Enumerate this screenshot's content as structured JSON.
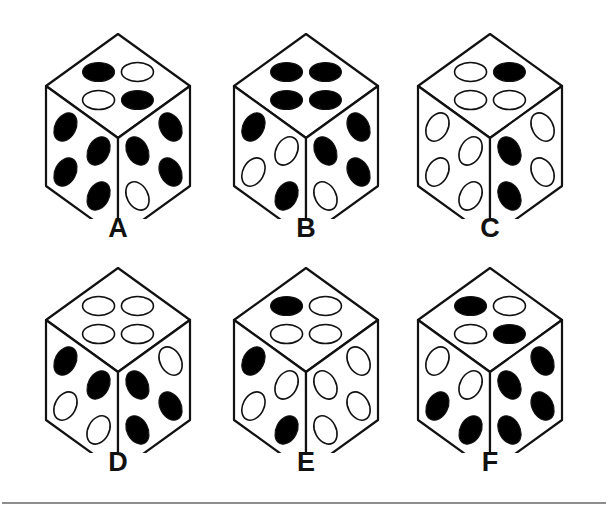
{
  "page": {
    "background_color": "#ffffff",
    "ink_color": "#111111",
    "pip_filled_color": "#000000",
    "pip_hollow_color": "#ffffff",
    "rule_color": "#8d8d8d",
    "columns": 3,
    "rows": 2,
    "total_dice": 6
  },
  "divider": {
    "name": "bottom-horizontal-rule",
    "visible": true
  },
  "dice": [
    {
      "label": "A",
      "x": 28,
      "y": 24,
      "top_face": {
        "back": "hollow",
        "left": "filled",
        "right": "filled",
        "front": "hollow",
        "filled_count": 2
      },
      "left_face": {
        "top_left": "filled",
        "top_right": "filled",
        "bottom_left": "filled",
        "bottom_right": "filled",
        "filled_count": 4
      },
      "right_face": {
        "top_left": "filled",
        "top_right": "filled",
        "bottom_left": "hollow",
        "bottom_right": "filled",
        "filled_count": 3
      }
    },
    {
      "label": "B",
      "x": 216,
      "y": 24,
      "top_face": {
        "back": "filled",
        "left": "filled",
        "right": "filled",
        "front": "filled",
        "filled_count": 4
      },
      "left_face": {
        "top_left": "filled",
        "top_right": "hollow",
        "bottom_left": "hollow",
        "bottom_right": "filled",
        "filled_count": 2
      },
      "right_face": {
        "top_left": "filled",
        "top_right": "filled",
        "bottom_left": "hollow",
        "bottom_right": "filled",
        "filled_count": 3
      }
    },
    {
      "label": "C",
      "x": 400,
      "y": 24,
      "top_face": {
        "back": "filled",
        "left": "hollow",
        "right": "hollow",
        "front": "hollow",
        "filled_count": 1
      },
      "left_face": {
        "top_left": "hollow",
        "top_right": "hollow",
        "bottom_left": "hollow",
        "bottom_right": "hollow",
        "filled_count": 0
      },
      "right_face": {
        "top_left": "filled",
        "top_right": "hollow",
        "bottom_left": "filled",
        "bottom_right": "hollow",
        "filled_count": 2
      }
    },
    {
      "label": "D",
      "x": 28,
      "y": 258,
      "top_face": {
        "back": "hollow",
        "left": "hollow",
        "right": "hollow",
        "front": "hollow",
        "filled_count": 0
      },
      "left_face": {
        "top_left": "filled",
        "top_right": "filled",
        "bottom_left": "hollow",
        "bottom_right": "hollow",
        "filled_count": 2
      },
      "right_face": {
        "top_left": "filled",
        "top_right": "hollow",
        "bottom_left": "filled",
        "bottom_right": "filled",
        "filled_count": 3
      }
    },
    {
      "label": "E",
      "x": 216,
      "y": 258,
      "top_face": {
        "back": "hollow",
        "left": "filled",
        "right": "hollow",
        "front": "hollow",
        "filled_count": 1
      },
      "left_face": {
        "top_left": "filled",
        "top_right": "hollow",
        "bottom_left": "hollow",
        "bottom_right": "filled",
        "filled_count": 2
      },
      "right_face": {
        "top_left": "hollow",
        "top_right": "hollow",
        "bottom_left": "hollow",
        "bottom_right": "hollow",
        "filled_count": 0
      }
    },
    {
      "label": "F",
      "x": 400,
      "y": 258,
      "top_face": {
        "back": "hollow",
        "left": "filled",
        "right": "filled",
        "front": "hollow",
        "filled_count": 2
      },
      "left_face": {
        "top_left": "hollow",
        "top_right": "hollow",
        "bottom_left": "filled",
        "bottom_right": "filled",
        "filled_count": 2
      },
      "right_face": {
        "top_left": "filled",
        "top_right": "filled",
        "bottom_left": "filled",
        "bottom_right": "filled",
        "filled_count": 4
      }
    }
  ]
}
